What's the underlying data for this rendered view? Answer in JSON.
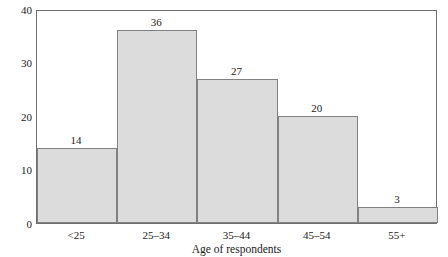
{
  "chart_data": {
    "type": "bar",
    "title": "",
    "subtitle": "",
    "xlabel": "Age of respondents",
    "ylabel": "Number of respondents",
    "categories": [
      "<25",
      "25–34",
      "35–44",
      "45–54",
      "55+"
    ],
    "values": [
      14,
      36,
      27,
      20,
      3
    ],
    "value_labels": [
      "14",
      "36",
      "27",
      "20",
      "3"
    ],
    "ylim": [
      0,
      40
    ],
    "yticks": [
      0,
      10,
      20,
      30,
      40
    ],
    "ytick_labels": [
      "0",
      "10",
      "20",
      "30",
      "40"
    ],
    "grid": false,
    "legend": null,
    "legend_position": "none",
    "bar_fill_color": "#dcdcdc",
    "bar_edge_color": "#818181",
    "axis_color": "#6e6e6e",
    "text_color": "#1a1a1a",
    "background_color": "#ffffff",
    "bar_gap": 0,
    "annotations": []
  }
}
